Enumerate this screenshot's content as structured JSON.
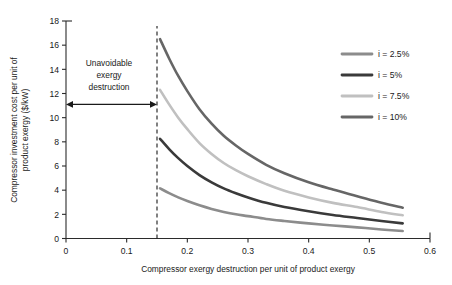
{
  "chart_data": {
    "type": "line",
    "title": "",
    "xlabel": "Compressor exergy destruction per unit of product exergy",
    "ylabel": "Compressor investment cost per unit of product exergy ($/kW)",
    "xlim": [
      0,
      0.6
    ],
    "ylim": [
      0,
      18
    ],
    "xticks": [
      "0",
      "0.1",
      "0.2",
      "0.3",
      "0.4",
      "0.5",
      "0.6"
    ],
    "xtick_values": [
      0,
      0.1,
      0.2,
      0.3,
      0.4,
      0.5,
      0.6
    ],
    "yticks": [
      "0",
      "2",
      "4",
      "6",
      "8",
      "10",
      "12",
      "14",
      "16",
      "18"
    ],
    "ytick_values": [
      0,
      2,
      4,
      6,
      8,
      10,
      12,
      14,
      16,
      18
    ],
    "grid": false,
    "legend_position": "right",
    "x": [
      0.155,
      0.17,
      0.185,
      0.2,
      0.22,
      0.24,
      0.26,
      0.28,
      0.3,
      0.33,
      0.36,
      0.4,
      0.44,
      0.48,
      0.52,
      0.555
    ],
    "series": [
      {
        "name": "i = 2.5%",
        "color": "#8c8c8c",
        "values": [
          4.15,
          3.75,
          3.4,
          3.1,
          2.75,
          2.45,
          2.2,
          2.0,
          1.85,
          1.62,
          1.45,
          1.25,
          1.08,
          0.92,
          0.75,
          0.62
        ]
      },
      {
        "name": "i = 5%",
        "color": "#3a3a3a",
        "values": [
          8.25,
          7.4,
          6.65,
          6.0,
          5.25,
          4.65,
          4.15,
          3.75,
          3.4,
          2.95,
          2.6,
          2.25,
          1.95,
          1.7,
          1.45,
          1.25
        ]
      },
      {
        "name": "i = 7.5%",
        "color": "#c0c0c0",
        "values": [
          12.3,
          11.1,
          10.0,
          9.05,
          7.9,
          7.0,
          6.25,
          5.65,
          5.15,
          4.5,
          3.95,
          3.4,
          2.95,
          2.6,
          2.2,
          1.92
        ]
      },
      {
        "name": "i = 10%",
        "color": "#666666",
        "values": [
          16.5,
          14.9,
          13.45,
          12.2,
          10.7,
          9.5,
          8.5,
          7.7,
          7.0,
          6.1,
          5.4,
          4.65,
          4.05,
          3.5,
          2.95,
          2.55
        ]
      }
    ],
    "annotations": [
      {
        "name": "unavoidable-exergy-destruction",
        "lines": [
          "Unavoidable",
          "exergy",
          "destruction"
        ],
        "arrow_from_x": 0,
        "arrow_to_x": 0.15,
        "arrow_y": 11.1
      }
    ],
    "divider": {
      "name": "unavoidable-boundary",
      "x": 0.15,
      "style": "dashed"
    }
  },
  "legend": {
    "items": [
      {
        "label": "i = 2.5%",
        "color": "#8c8c8c"
      },
      {
        "label": "i = 5%",
        "color": "#3a3a3a"
      },
      {
        "label": "i = 7.5%",
        "color": "#c0c0c0"
      },
      {
        "label": "i = 10%",
        "color": "#666666"
      }
    ]
  },
  "annotation": {
    "line1": "Unavoidable",
    "line2": "exergy",
    "line3": "destruction"
  }
}
